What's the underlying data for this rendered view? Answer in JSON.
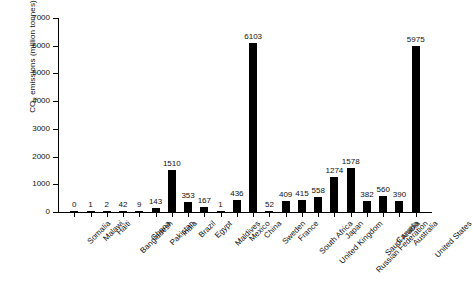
{
  "chart_data": {
    "type": "bar",
    "title": "",
    "subtitle": "",
    "xlabel": "",
    "ylabel": "CO2 emissions (million tonnes)",
    "ylabel_parts": {
      "pre": "CO",
      "sub": "2",
      "post": " emissions (million tonnes)"
    },
    "ylim": [
      0,
      7000
    ],
    "ytick_labels": [
      "0",
      "1000",
      "2000",
      "3000",
      "4000",
      "5000",
      "6000",
      "7000"
    ],
    "ytick_values": [
      0,
      1000,
      2000,
      3000,
      4000,
      5000,
      6000,
      7000
    ],
    "grid": false,
    "legend": false,
    "bar_color": "#000000",
    "value_labels_shown": true,
    "categories": [
      "Somalia",
      "Malawi",
      "Haiti",
      "Bangladesh",
      "Ghana",
      "Pakistan",
      "India",
      "Brazil",
      "Egypt",
      "Maldives",
      "Mexico",
      "China",
      "Sweden",
      "France",
      "South Africa",
      "United Kingdom",
      "Japan",
      "Russian Federation",
      "Saudi Arabia",
      "Canada",
      "Australia",
      "United States"
    ],
    "values": [
      0,
      1,
      2,
      42,
      9,
      143,
      1510,
      353,
      167,
      1,
      436,
      6103,
      52,
      409,
      415,
      558,
      1274,
      1578,
      382,
      560,
      390,
      5975
    ],
    "value_labels": [
      "0",
      "1",
      "2",
      "42",
      "9",
      "143",
      "1510",
      "353",
      "167",
      "1",
      "436",
      "6103",
      "52",
      "409",
      "415",
      "558",
      "1274",
      "1578",
      "382",
      "560",
      "390",
      "5975"
    ]
  }
}
